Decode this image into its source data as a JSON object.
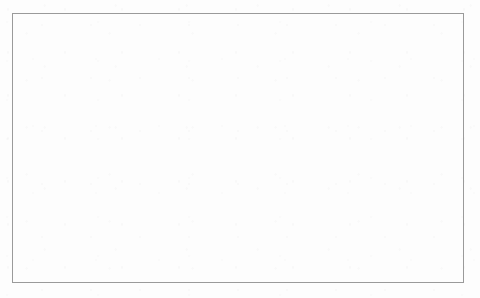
{
  "diagram": {
    "frame": {
      "stroke": "#9a9a9a"
    },
    "node_style": {
      "stroke": "#6f6f6f",
      "fill": "#ffffff",
      "text": "#1b1b1b"
    },
    "nodes": [
      {
        "id": "operation_declaration",
        "label": "operation_declaration",
        "x": 145,
        "y": 15,
        "w": 81,
        "h": 16,
        "font_size": 6.2
      },
      {
        "id": "qsharp_declaration",
        "label": "qsharp_declaration",
        "x": 152,
        "y": 42,
        "w": 70,
        "h": 16,
        "font_size": 6.2
      },
      {
        "id": "identifier",
        "label": "identifier",
        "x": 20,
        "y": 70,
        "w": 52,
        "h": 17,
        "font_size": 6.4
      },
      {
        "id": "quantum_formal_parameter_list",
        "label": "quantum_formal_parameter_list",
        "x": 80,
        "y": 70,
        "w": 124,
        "h": 17,
        "font_size": 6.3
      },
      {
        "id": "quantum_return_type",
        "label": "quantum_return_type",
        "x": 208,
        "y": 70,
        "w": 80,
        "h": 17,
        "font_size": 6.3
      },
      {
        "id": "quantum_using",
        "label": "quantum_using",
        "x": 290,
        "y": 70,
        "w": 56,
        "h": 17,
        "font_size": 6.3
      },
      {
        "id": "IDENTIFIER",
        "label": "IDENTIFIER",
        "x": 36,
        "y": 99,
        "w": 56,
        "h": 17,
        "font_size": 6.2
      },
      {
        "id": "quantum_qubit_assingment",
        "label": "quantum_qubit_assingment",
        "x": 222,
        "y": 105,
        "w": 115,
        "h": 17,
        "font_size": 6.2
      },
      {
        "id": "quantum_body",
        "label": "quantum_body",
        "x": 358,
        "y": 105,
        "w": 62,
        "h": 17,
        "font_size": 6.3
      },
      {
        "id": "qubit_declaration",
        "label": "qubit_declaration",
        "x": 172,
        "y": 131,
        "w": 76,
        "h": 17,
        "font_size": 6.3
      },
      {
        "id": "block",
        "label": "block",
        "x": 366,
        "y": 131,
        "w": 48,
        "h": 17,
        "font_size": 7.2
      },
      {
        "id": "statement",
        "label": "statement",
        "x": 325,
        "y": 159,
        "w": 47,
        "h": 17,
        "font_size": 6.2
      },
      {
        "id": "quantum_gate_op",
        "label": "quantum_gate_op",
        "x": 376,
        "y": 159,
        "w": 66,
        "h": 17,
        "font_size": 6.2
      },
      {
        "id": "qubit_identifier",
        "label": "qubit_identifier",
        "x": 188,
        "y": 159,
        "w": 66,
        "h": 17,
        "font_size": 6.2
      },
      {
        "id": "one_gate_op",
        "label": "one_gate_op",
        "x": 379,
        "y": 191,
        "w": 57,
        "h": 17,
        "font_size": 6.4
      },
      {
        "id": "quantum_gates_one_op",
        "label": "quantum_gates_one_op",
        "x": 367,
        "y": 217,
        "w": 87,
        "h": 17,
        "font_size": 6.2
      },
      {
        "id": "HADAMARD",
        "label": "HADAMARD",
        "x": 386,
        "y": 244,
        "w": 56,
        "h": 17,
        "font_size": 6.2
      },
      {
        "id": "MEASURE",
        "label": "MEASURE",
        "x": 386,
        "y": 266,
        "w": 56,
        "h": 17,
        "font_size": 6.2
      }
    ],
    "edges": [
      {
        "from": "operation_declaration",
        "to": "qsharp_declaration",
        "kind": "vertical"
      },
      {
        "from": "qsharp_declaration",
        "to": "identifier",
        "kind": "elbow"
      },
      {
        "from": "qsharp_declaration",
        "to": "quantum_formal_parameter_list",
        "kind": "elbow"
      },
      {
        "from": "qsharp_declaration",
        "to": "quantum_return_type",
        "kind": "elbow"
      },
      {
        "from": "qsharp_declaration",
        "to": "quantum_using",
        "kind": "elbow"
      },
      {
        "from": "identifier",
        "to": "IDENTIFIER",
        "kind": "left-elbow"
      },
      {
        "from": "quantum_using",
        "to": "quantum_qubit_assingment",
        "kind": "elbow"
      },
      {
        "from": "quantum_using",
        "to": "quantum_body",
        "kind": "elbow"
      },
      {
        "from": "quantum_qubit_assingment",
        "to": "qubit_declaration",
        "kind": "elbow"
      },
      {
        "from": "qubit_declaration",
        "to": "qubit_identifier",
        "kind": "left-elbow"
      },
      {
        "from": "quantum_body",
        "to": "block",
        "kind": "vertical"
      },
      {
        "from": "block",
        "to": "statement",
        "kind": "elbow"
      },
      {
        "from": "block",
        "to": "quantum_gate_op",
        "kind": "elbow"
      },
      {
        "from": "quantum_gate_op",
        "to": "one_gate_op",
        "kind": "vertical"
      },
      {
        "from": "one_gate_op",
        "to": "quantum_gates_one_op",
        "kind": "elbow"
      },
      {
        "from": "quantum_gates_one_op",
        "to": "HADAMARD",
        "kind": "left-elbow"
      },
      {
        "from": "quantum_gates_one_op",
        "to": "MEASURE",
        "kind": "left-elbow"
      }
    ]
  }
}
